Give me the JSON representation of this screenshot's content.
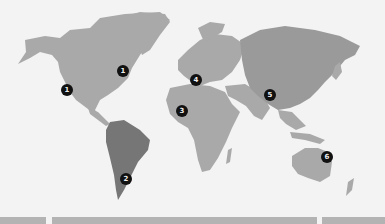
{
  "map": {
    "colors": {
      "background": "#f3f3f3",
      "land": "#a9a9a9",
      "south_america": "#767676",
      "asia": "#9a9a9a",
      "marker": "#111111"
    },
    "markers": [
      {
        "label": "1",
        "region": "north-america-west",
        "x": 67,
        "y": 90
      },
      {
        "label": "1",
        "region": "north-america-east",
        "x": 123,
        "y": 71
      },
      {
        "label": "2",
        "region": "south-america",
        "x": 126,
        "y": 179
      },
      {
        "label": "3",
        "region": "africa",
        "x": 182,
        "y": 111
      },
      {
        "label": "4",
        "region": "europe",
        "x": 196,
        "y": 80
      },
      {
        "label": "5",
        "region": "asia",
        "x": 270,
        "y": 95
      },
      {
        "label": "6",
        "region": "australia",
        "x": 327,
        "y": 157
      }
    ]
  }
}
